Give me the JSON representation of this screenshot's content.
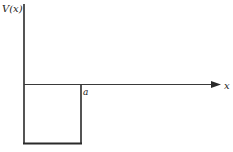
{
  "diagram": {
    "type": "finite-square-well-potential",
    "y_axis_label": "V(x)",
    "x_axis_label": "x",
    "well_edge_label": "a",
    "line_color": "#2a2a2a",
    "background": "#ffffff"
  }
}
